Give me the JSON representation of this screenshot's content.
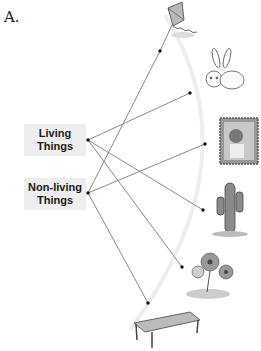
{
  "section": {
    "label": "A."
  },
  "categories": [
    {
      "line1": "Living",
      "line2": "Things"
    },
    {
      "line1": "Non-living",
      "line2": "Things"
    }
  ],
  "items": [
    {
      "name": "kite",
      "category": "Non-living Things"
    },
    {
      "name": "rabbit",
      "category": "Living Things"
    },
    {
      "name": "stamp",
      "category": "Non-living Things"
    },
    {
      "name": "cactus",
      "category": "Living Things"
    },
    {
      "name": "flowers",
      "category": "Living Things"
    },
    {
      "name": "table",
      "category": "Non-living Things"
    }
  ],
  "colors": {
    "line": "#777777",
    "dot": "#111111",
    "arc": "#eeeeee",
    "label_bg": "#eeeeee"
  }
}
